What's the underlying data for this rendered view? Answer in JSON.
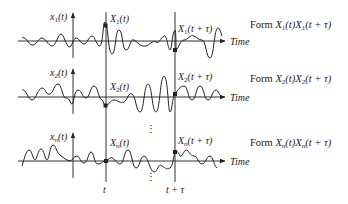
{
  "diagram": {
    "type": "ensemble-autocorrelation",
    "rows": [
      {
        "id": "1",
        "axis_label": "x1(t)",
        "axis_label_base": "x",
        "axis_label_sub": "1",
        "sample_t_label_base": "X",
        "sample_t_label_sub": "1",
        "sample_t_label_arg": "(t)",
        "sample_ttau_label_base": "X",
        "sample_ttau_label_sub": "1",
        "sample_ttau_label_arg": "(t + τ)",
        "time_label": "Time",
        "form_prefix": "Form ",
        "form_product": "X1(t)X1(t + τ)",
        "form_a_base": "X",
        "form_a_sub": "1",
        "form_a_arg": "(t)",
        "form_b_base": "X",
        "form_b_sub": "1",
        "form_b_arg": "(t + τ)"
      },
      {
        "id": "2",
        "axis_label": "x2(t)",
        "axis_label_base": "x",
        "axis_label_sub": "2",
        "sample_t_label_base": "X",
        "sample_t_label_sub": "2",
        "sample_t_label_arg": "(t)",
        "sample_ttau_label_base": "X",
        "sample_ttau_label_sub": "2",
        "sample_ttau_label_arg": "(t + τ)",
        "time_label": "Time",
        "form_prefix": "Form ",
        "form_product": "X2(t)X2(t + τ)",
        "form_a_base": "X",
        "form_a_sub": "2",
        "form_a_arg": "(t)",
        "form_b_base": "X",
        "form_b_sub": "2",
        "form_b_arg": "(t + τ)"
      },
      {
        "id": "n",
        "axis_label": "xn(t)",
        "axis_label_base": "x",
        "axis_label_sub": "n",
        "sample_t_label_base": "X",
        "sample_t_label_sub": "n",
        "sample_t_label_arg": "(t)",
        "sample_ttau_label_base": "X",
        "sample_ttau_label_sub": "n",
        "sample_ttau_label_arg": "(t + τ)",
        "time_label": "Time",
        "form_prefix": "Form ",
        "form_product": "Xn(t)Xn(t + τ)",
        "form_a_base": "X",
        "form_a_sub": "n",
        "form_a_arg": "(t)",
        "form_b_base": "X",
        "form_b_sub": "n",
        "form_b_arg": "(t + τ)"
      }
    ],
    "vertical_markers": [
      {
        "label": "t"
      },
      {
        "label": "t + τ"
      }
    ],
    "ellipsis": "⋮",
    "colors": {
      "line": "#222222",
      "background": "#ffffff"
    }
  }
}
